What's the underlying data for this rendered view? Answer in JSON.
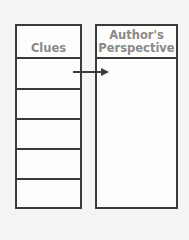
{
  "diagram": {
    "left_column": {
      "header": "Clues",
      "row_count": 5
    },
    "right_column": {
      "header_line1": "Author's",
      "header_line2": "Perspective"
    },
    "connector": {
      "from": "Clues row 1",
      "to": "Author's Perspective",
      "type": "arrow"
    },
    "colors": {
      "border": "#3a3a3a",
      "header_text": "#8a8a8a",
      "background": "#f4f4f2"
    }
  }
}
